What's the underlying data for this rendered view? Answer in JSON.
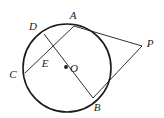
{
  "figure": {
    "kind": "circle-geometry-diagram",
    "width": 164,
    "height": 118,
    "background_color": "#ffffff",
    "stroke_color": "#1a1a1a",
    "circle_stroke_width": 1.6,
    "line_stroke_width": 0.9
  },
  "circle": {
    "center_label": "O",
    "cx": 67,
    "cy": 68,
    "r": 44
  },
  "center_dot": {
    "cx": 66,
    "cy": 67,
    "r": 1.9
  },
  "points": [
    {
      "id": "A",
      "label": "A",
      "x": 74,
      "y": 26,
      "label_x": 73,
      "label_y": 15
    },
    {
      "id": "B",
      "label": "B",
      "x": 93,
      "y": 98,
      "label_x": 97,
      "label_y": 107
    },
    {
      "id": "C",
      "label": "C",
      "x": 25,
      "y": 73,
      "label_x": 13,
      "label_y": 74
    },
    {
      "id": "D",
      "label": "D",
      "x": 44,
      "y": 34,
      "label_x": 33,
      "label_y": 26
    },
    {
      "id": "E",
      "label": "E",
      "x": 48,
      "y": 52,
      "label_x": 45,
      "label_y": 63
    },
    {
      "id": "O",
      "label": "O",
      "x": 66,
      "y": 67,
      "label_x": 74,
      "label_y": 68
    },
    {
      "id": "P",
      "label": "P",
      "x": 142,
      "y": 46,
      "label_x": 150,
      "label_y": 43
    }
  ],
  "segments": [
    {
      "id": "chord-CA",
      "from": "C",
      "to": "A",
      "x1": 25,
      "y1": 73,
      "x2": 74,
      "y2": 26
    },
    {
      "id": "diameter-DB",
      "from": "D",
      "to": "B",
      "x1": 44,
      "y1": 34,
      "x2": 93,
      "y2": 98
    },
    {
      "id": "tangent-AP",
      "from": "A",
      "to": "P",
      "x1": 74,
      "y1": 26,
      "x2": 142,
      "y2": 46
    },
    {
      "id": "tangent-BP",
      "from": "B",
      "to": "P",
      "x1": 93,
      "y1": 98,
      "x2": 142,
      "y2": 46
    }
  ]
}
